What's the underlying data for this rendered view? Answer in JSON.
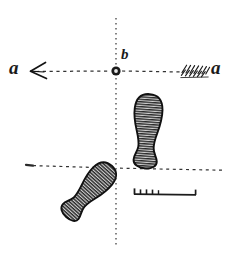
{
  "figure": {
    "background_color": "#ffffff",
    "ink_color": "#1a1a1a",
    "width": 233,
    "height": 257
  },
  "labels": {
    "a_left": "a",
    "a_right": "a",
    "b_center": "b"
  },
  "axes": {
    "vertical": {
      "name": "vertical-axis",
      "x": 116,
      "y_start": 18,
      "y_end": 246,
      "style": "dashed"
    },
    "horizontal_main": {
      "name": "horizontal-axis-a-a",
      "y": 71,
      "x_start": 32,
      "x_end": 208,
      "style": "dashed"
    },
    "horizontal_lower": {
      "name": "lower-baseline",
      "y_left": 165,
      "y_right": 170,
      "x_start": 25,
      "x_end": 222,
      "style": "dashed"
    }
  },
  "center_point": {
    "name": "point-b",
    "cx": 116,
    "cy": 71,
    "r": 4
  },
  "arrow": {
    "head_side": "left",
    "head_x": 32,
    "head_y": 71,
    "fletching_side": "right",
    "fletching_x_start": 180,
    "fletching_x_end": 208,
    "fletching_count": 7
  },
  "footprints": [
    {
      "name": "right-footprint",
      "position": "upper-right",
      "cx": 147,
      "cy": 131,
      "length": 74,
      "width": 29,
      "rotation_deg": 4,
      "hatch": "horizontal"
    },
    {
      "name": "left-footprint",
      "position": "lower-left",
      "cx": 89,
      "cy": 191,
      "length": 68,
      "width": 26,
      "rotation_deg": 42,
      "hatch": "horizontal"
    }
  ],
  "scale_bar": {
    "name": "scale-bar",
    "x_start": 134,
    "x_end": 196,
    "y": 194,
    "minor_ticks": [
      134,
      140,
      146,
      152,
      158
    ],
    "end_tick": 196
  }
}
